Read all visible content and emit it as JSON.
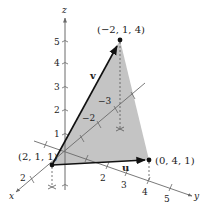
{
  "figure": {
    "type": "3d-vector-diagram",
    "colors": {
      "triangle_fill": "#c4c4c4",
      "axis": "#6a6a6a",
      "vector": "#111111",
      "dashed": "#555555",
      "text": "#222222"
    },
    "axes": {
      "x": {
        "name": "x",
        "ticks": [
          "2"
        ]
      },
      "y": {
        "name": "y",
        "ticks": [
          "2",
          "3",
          "4",
          "5"
        ]
      },
      "z": {
        "name": "z",
        "ticks": [
          "1",
          "2",
          "3",
          "4",
          "5"
        ]
      },
      "neg_x": {
        "ticks": [
          "−2",
          "−3"
        ]
      }
    },
    "points": [
      {
        "label": "(−2, 1, 4)"
      },
      {
        "label": "(2, 1, 1)"
      },
      {
        "label": "(0, 4, 1)"
      }
    ],
    "vectors": [
      {
        "name": "v"
      },
      {
        "name": "u"
      }
    ]
  }
}
